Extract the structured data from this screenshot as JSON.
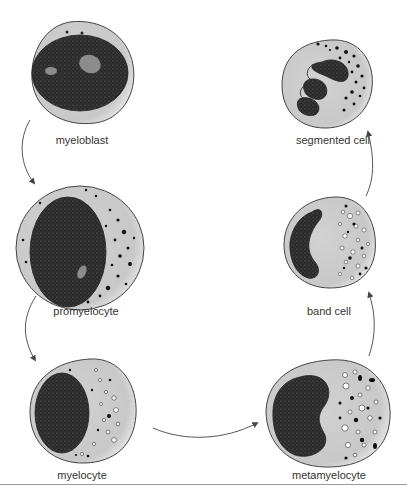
{
  "diagram": {
    "type": "process-cycle",
    "colors": {
      "cytoplasm": "#cfcfcf",
      "cytoplasm_highlight": "#e6e6e6",
      "nucleus": "#2b2b2b",
      "nucleolus": "#8c8c8c",
      "outline": "#444444",
      "arrow": "#444444",
      "rule": "#9a9a9a"
    },
    "stages": [
      {
        "id": "myeloblast",
        "label": "myeloblast",
        "order": 1
      },
      {
        "id": "promyelocyte",
        "label": "promyelocyte",
        "order": 2
      },
      {
        "id": "myelocyte",
        "label": "myelocyte",
        "order": 3
      },
      {
        "id": "metamyelocyte",
        "label": "metamyelocyte",
        "order": 4
      },
      {
        "id": "band-cell",
        "label": "band cell",
        "order": 5
      },
      {
        "id": "segmented-cell",
        "label": "segmented cell",
        "order": 6
      }
    ],
    "arrows": [
      {
        "from": "myeloblast",
        "to": "promyelocyte"
      },
      {
        "from": "promyelocyte",
        "to": "myelocyte"
      },
      {
        "from": "myelocyte",
        "to": "metamyelocyte"
      },
      {
        "from": "metamyelocyte",
        "to": "band-cell"
      },
      {
        "from": "band-cell",
        "to": "segmented-cell"
      }
    ]
  }
}
